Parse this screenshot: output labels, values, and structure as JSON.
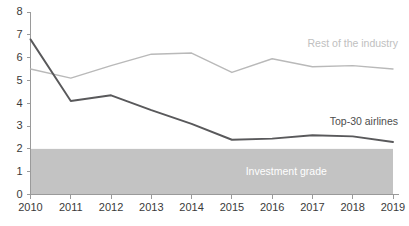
{
  "chart_data": {
    "type": "line",
    "title": "",
    "xlabel": "",
    "ylabel": "",
    "categories": [
      "2010",
      "2011",
      "2012",
      "2013",
      "2014",
      "2015",
      "2016",
      "2017",
      "2018",
      "2019"
    ],
    "x": [
      2010,
      2011,
      2012,
      2013,
      2014,
      2015,
      2016,
      2017,
      2018,
      2019
    ],
    "xlim": [
      2010,
      2019
    ],
    "ylim": [
      0,
      8
    ],
    "yticks": [
      0,
      1,
      2,
      3,
      4,
      5,
      6,
      7,
      8
    ],
    "ytick_labels": [
      "0",
      "1",
      "2",
      "3",
      "4",
      "5",
      "6",
      "7",
      "8"
    ],
    "grid": false,
    "legend_position": "inline-annotation",
    "series": [
      {
        "name": "Top-30 airlines",
        "color": "#59595b",
        "values": [
          6.8,
          4.1,
          4.35,
          3.7,
          3.1,
          2.4,
          2.45,
          2.6,
          2.55,
          2.3
        ]
      },
      {
        "name": "Rest of the industry",
        "color": "#b9b9b9",
        "values": [
          5.5,
          5.1,
          5.65,
          6.15,
          6.2,
          5.35,
          5.95,
          5.6,
          5.65,
          5.5
        ]
      }
    ],
    "annotations": [
      {
        "name": "rest-of-industry-label",
        "text": "Rest of the industry",
        "color": "#c0c0c0",
        "x": 2019,
        "y": 6.45
      },
      {
        "name": "top-30-airlines-label",
        "text": "Top-30 airlines",
        "color": "#4d4d4d",
        "x": 2019,
        "y": 3.05
      }
    ],
    "shaded_regions": [
      {
        "name": "investment-grade-band",
        "label": "Investment grade",
        "label_color": "#ffffff",
        "fill": "#c3c3c3",
        "y_from": 0,
        "y_to": 2,
        "x_from": 2010,
        "x_to": 2019
      }
    ]
  },
  "colors": {
    "background": "#ffffff",
    "axis": "#9a9a9a",
    "tick_text": "#3a3a3a",
    "top30": "#59595b",
    "rest": "#b9b9b9",
    "band": "#c3c3c3"
  }
}
